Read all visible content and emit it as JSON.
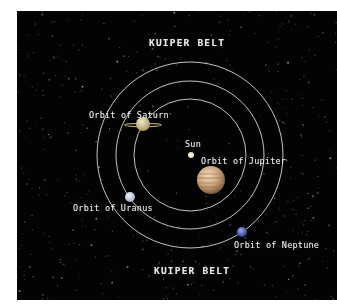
{
  "diagram": {
    "title_top": "KUIPER BELT",
    "title_bottom": "KUIPER BELT",
    "background": "#030303",
    "orbit_color": "#d8d8d8",
    "center": {
      "x": 173,
      "y": 144
    },
    "orbits": [
      {
        "name": "orbit-of-saturn-ring",
        "r": 56
      },
      {
        "name": "orbit-of-uranus-ring",
        "r": 74
      },
      {
        "name": "orbit-of-neptune-ring",
        "r": 93
      }
    ],
    "bodies": {
      "sun": {
        "label": "Sun",
        "x": 174,
        "y": 144,
        "r": 3,
        "color": "#f4efd8"
      },
      "saturn": {
        "label": "Orbit of Saturn",
        "x": 126,
        "y": 113,
        "r": 7,
        "color": "#d9cc9a"
      },
      "jupiter": {
        "label": "Orbit of Jupiter",
        "x": 194,
        "y": 169,
        "r": 14,
        "color": "#c8a27a"
      },
      "uranus": {
        "label": "Orbit of Uranus",
        "x": 113,
        "y": 186,
        "r": 5,
        "color": "#c9d6e4"
      },
      "neptune": {
        "label": "Orbit of Neptune",
        "x": 225,
        "y": 221,
        "r": 5,
        "color": "#5a6fc0"
      }
    },
    "stars": {
      "count": 520,
      "seed": 7,
      "colors": [
        "#8a8a8a",
        "#a0504a",
        "#5f8a5a",
        "#b8b8b0",
        "#6f6a9a"
      ]
    }
  }
}
